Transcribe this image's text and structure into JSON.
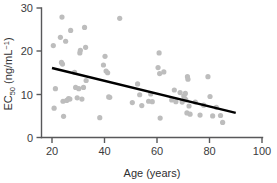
{
  "chart_data": {
    "type": "scatter",
    "title": "",
    "subtitle": "",
    "xlabel": "Age (years)",
    "ylabel": "EC50 (ng/mL-1)",
    "ylabel_parts": {
      "base": "EC",
      "subscript": "50",
      "units_prefix": " (ng/mL",
      "units_superscript": "−1",
      "units_suffix": ")"
    },
    "xlim": [
      20,
      100
    ],
    "ylim": [
      0,
      30
    ],
    "xticks": [
      20,
      40,
      60,
      80,
      100
    ],
    "xtick_labels": [
      "20",
      "40",
      "60",
      "80",
      "100"
    ],
    "yticks": [
      0,
      10,
      20,
      30
    ],
    "ytick_labels": [
      "0",
      "10",
      "20",
      "30"
    ],
    "grid": false,
    "legend": false,
    "legend_position": "none",
    "marker": {
      "shape": "circle",
      "color": "#bdbdbd",
      "radius_px": 2.6
    },
    "series": [
      {
        "name": "EC50 vs Age",
        "points": [
          [
            20.5,
            21.3
          ],
          [
            20.8,
            6.8
          ],
          [
            21.3,
            11.3
          ],
          [
            23.2,
            23.2
          ],
          [
            23.8,
            27.9
          ],
          [
            23.6,
            17.4
          ],
          [
            24.0,
            17.0
          ],
          [
            24.2,
            8.4
          ],
          [
            24.4,
            4.9
          ],
          [
            25.2,
            22.3
          ],
          [
            25.6,
            8.6
          ],
          [
            26.3,
            9.0
          ],
          [
            26.8,
            8.9
          ],
          [
            27.1,
            24.8
          ],
          [
            28.6,
            15.1
          ],
          [
            29.0,
            11.6
          ],
          [
            29.6,
            9.2
          ],
          [
            30.2,
            11.3
          ],
          [
            30.6,
            19.6
          ],
          [
            30.8,
            20.2
          ],
          [
            31.4,
            8.9
          ],
          [
            32.0,
            11.6
          ],
          [
            32.4,
            25.5
          ],
          [
            32.8,
            20.9
          ],
          [
            33.0,
            13.2
          ],
          [
            38.2,
            4.6
          ],
          [
            39.6,
            16.8
          ],
          [
            40.2,
            18.8
          ],
          [
            40.6,
            15.4
          ],
          [
            41.2,
            15.0
          ],
          [
            41.6,
            9.4
          ],
          [
            42.0,
            9.3
          ],
          [
            45.8,
            27.6
          ],
          [
            50.6,
            8.1
          ],
          [
            52.6,
            12.4
          ],
          [
            53.4,
            9.9
          ],
          [
            54.2,
            7.4
          ],
          [
            56.8,
            8.4
          ],
          [
            57.6,
            10.1
          ],
          [
            58.2,
            8.3
          ],
          [
            60.4,
            16.2
          ],
          [
            60.8,
            19.6
          ],
          [
            61.0,
            14.8
          ],
          [
            61.2,
            4.5
          ],
          [
            62.6,
            15.2
          ],
          [
            65.6,
            8.7
          ],
          [
            66.6,
            11.0
          ],
          [
            67.2,
            8.3
          ],
          [
            68.8,
            10.4
          ],
          [
            69.6,
            8.2
          ],
          [
            70.2,
            9.6
          ],
          [
            70.6,
            9.0
          ],
          [
            70.8,
            10.2
          ],
          [
            71.0,
            8.7
          ],
          [
            71.4,
            5.7
          ],
          [
            71.6,
            14.1
          ],
          [
            71.8,
            13.5
          ],
          [
            72.2,
            7.3
          ],
          [
            72.6,
            5.4
          ],
          [
            74.6,
            8.2
          ],
          [
            76.4,
            5.2
          ],
          [
            77.8,
            7.5
          ],
          [
            79.4,
            14.1
          ],
          [
            80.2,
            9.5
          ],
          [
            81.2,
            5.0
          ],
          [
            82.6,
            7.0
          ],
          [
            84.2,
            5.1
          ],
          [
            85.0,
            3.5
          ]
        ]
      }
    ],
    "trendline": {
      "type": "linear-regression",
      "x_start": 20,
      "y_start": 16.1,
      "x_end": 90,
      "y_end": 5.7,
      "color": "#000000"
    }
  }
}
